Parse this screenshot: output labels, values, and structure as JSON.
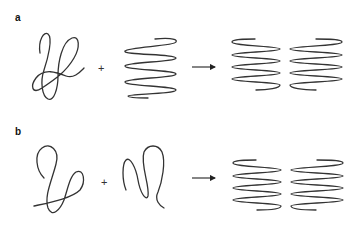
{
  "panels": [
    {
      "label": "a",
      "operator": "+",
      "reactants": [
        "random-coil",
        "helix"
      ],
      "product": "two-helices"
    },
    {
      "label": "b",
      "operator": "+",
      "reactants": [
        "random-coil",
        "random-coil"
      ],
      "product": "two-helices"
    }
  ],
  "colors": {
    "stroke": "#333333",
    "background": "#ffffff"
  }
}
